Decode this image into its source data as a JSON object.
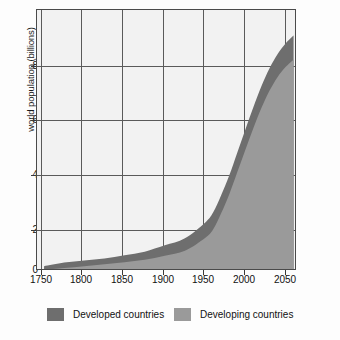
{
  "chart_data": {
    "type": "area",
    "title": "",
    "subtitle": "",
    "xlabel": "",
    "ylabel": "world population (billions)",
    "xlim": [
      1740,
      2063
    ],
    "ylim": [
      0,
      9.6
    ],
    "xticks": [
      1750,
      1800,
      1850,
      1900,
      1950,
      2000,
      2050
    ],
    "yticks": [
      0,
      2,
      4,
      6,
      8
    ],
    "grid": true,
    "stacked": true,
    "legend_position": "bottom",
    "x": [
      1750,
      1775,
      1800,
      1825,
      1850,
      1875,
      1900,
      1925,
      1950,
      1960,
      1970,
      1980,
      1990,
      2000,
      2010,
      2020,
      2030,
      2040,
      2050,
      2060
    ],
    "series": [
      {
        "name": "Developing countries",
        "color": "#9a9a9a",
        "values": [
          0.55,
          0.62,
          0.69,
          0.76,
          0.83,
          0.92,
          1.07,
          1.25,
          1.72,
          2.03,
          2.62,
          3.31,
          4.12,
          4.94,
          5.73,
          6.47,
          7.1,
          7.6,
          7.97,
          8.24
        ]
      },
      {
        "name": "Developed countries",
        "color": "#6e6e6e",
        "values": [
          0.14,
          0.2,
          0.21,
          0.21,
          0.26,
          0.3,
          0.38,
          0.46,
          0.56,
          0.62,
          0.66,
          0.69,
          0.72,
          0.74,
          0.77,
          0.8,
          0.82,
          0.84,
          0.86,
          0.88
        ]
      }
    ],
    "totals": [
      0.69,
      0.82,
      0.9,
      0.97,
      1.09,
      1.22,
      1.45,
      1.71,
      2.28,
      2.65,
      3.28,
      4.0,
      4.84,
      5.68,
      6.5,
      7.27,
      7.92,
      8.44,
      8.83,
      9.12
    ]
  },
  "axes": {
    "ylabel": "world population (billions)",
    "yticks": [
      "8",
      "6",
      "4",
      "2",
      "0"
    ],
    "xticks": [
      "1750",
      "1800",
      "1850",
      "1900",
      "1950",
      "2000",
      "2050"
    ]
  },
  "legend": {
    "items": [
      {
        "label": "Developed countries",
        "color": "#6e6e6e"
      },
      {
        "label": "Developing countries",
        "color": "#9a9a9a"
      }
    ]
  },
  "colors": {
    "developed": "#6e6e6e",
    "developing": "#9a9a9a",
    "grid": "#5a5a5a",
    "frame": "#4a4a4a",
    "plot_background": "#f2f2f2",
    "page_background": "#fdfdfd"
  }
}
